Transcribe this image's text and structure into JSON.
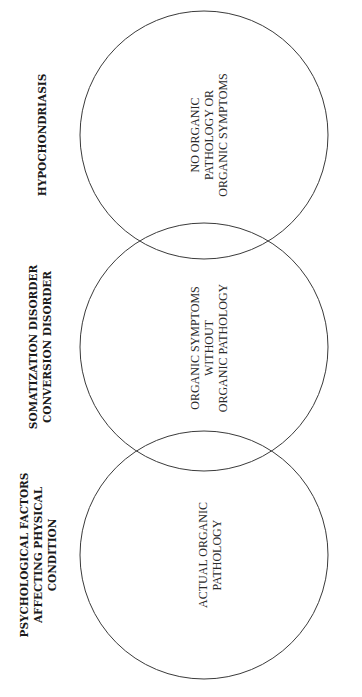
{
  "diagram": {
    "type": "venn-chain",
    "orientation": "rotated-90-ccw",
    "stroke_color": "#3a3a3a",
    "circles": [
      {
        "id": "actual-organic",
        "category_lines": [
          "PSYCHOLOGICAL FACTORS",
          "AFFECTING PHYSICAL",
          "CONDITION"
        ],
        "inner_lines": [
          "ACTUAL ORGANIC",
          "PATHOLOGY"
        ]
      },
      {
        "id": "symptoms-without-pathology",
        "category_lines": [
          "SOMATIZATION DISORDER",
          "CONVERSION DISORDER"
        ],
        "inner_lines": [
          "ORGANIC SYMPTOMS",
          "WITHOUT",
          "ORGANIC PATHOLOGY"
        ]
      },
      {
        "id": "no-pathology",
        "category_lines": [
          "HYPOCHONDRIASIS"
        ],
        "inner_lines": [
          "NO ORGANIC",
          "PATHOLOGY OR",
          "ORGANIC SYMPTOMS"
        ]
      }
    ]
  }
}
